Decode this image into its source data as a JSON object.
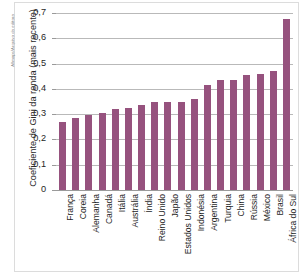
{
  "credit": "Allmaps/Arquivo da editora",
  "chart_data": {
    "type": "bar",
    "title": "",
    "xlabel": "",
    "ylabel": "Coeficiente de Gini da renda (mais recente)",
    "ylim": [
      0,
      0.7
    ],
    "ytick_labels": [
      "0,7",
      "0,6",
      "0,5",
      "0,4",
      "0,3",
      "0,2",
      "0,1",
      "0"
    ],
    "ytick_values": [
      0.7,
      0.6,
      0.5,
      0.4,
      0.3,
      0.2,
      0.1,
      0
    ],
    "grid": true,
    "legend": "none",
    "bar_color": "#96527e",
    "categories": [
      "França",
      "Coreia",
      "Alemanha",
      "Canadá",
      "Itália",
      "Austrália",
      "Índia",
      "Reino Unido",
      "Japão",
      "Estados Unidos",
      "Indonésia",
      "Argentina",
      "Turquia",
      "China",
      "Rússia",
      "México",
      "Brasil",
      "África do Sul"
    ],
    "values": [
      0.27,
      0.285,
      0.295,
      0.305,
      0.32,
      0.325,
      0.335,
      0.35,
      0.35,
      0.35,
      0.36,
      0.415,
      0.435,
      0.435,
      0.455,
      0.46,
      0.47,
      0.675
    ]
  }
}
